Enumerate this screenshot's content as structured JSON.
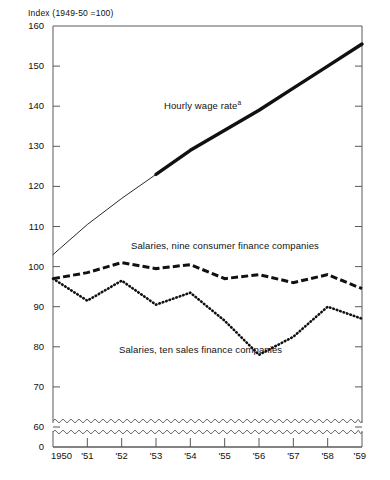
{
  "chart_data": {
    "type": "line",
    "title": "Index (1949-50 =100)",
    "xlabel": "",
    "ylabel": "Index (1949-50 =100)",
    "x": [
      1950,
      1951,
      1952,
      1953,
      1954,
      1955,
      1956,
      1957,
      1958,
      1959
    ],
    "categories": [
      "1950",
      "'51",
      "'52",
      "'53",
      "'54",
      "'55",
      "'56",
      "'57",
      "'58",
      "'59"
    ],
    "xlim": [
      1950,
      1959
    ],
    "ylim": [
      60,
      160
    ],
    "y_axis_break": true,
    "y_break_from": 0,
    "y_break_to": 60,
    "yticks": [
      160,
      150,
      140,
      130,
      120,
      110,
      100,
      90,
      80,
      70,
      60,
      0
    ],
    "ytick_labels": [
      "160",
      "150",
      "140",
      "130",
      "120",
      "110",
      "100",
      "90",
      "80",
      "70",
      "60",
      "0"
    ],
    "grid": false,
    "legend_position": "inline-annotations",
    "series": [
      {
        "name": "Hourly wage rate",
        "label": "Hourly wage rate",
        "footnote_marker": "a",
        "style": "solid",
        "note": "thin line 1950-1953, heavy line 1953-1959",
        "values": [
          103,
          110.5,
          117,
          123,
          129,
          134,
          139,
          144.5,
          150,
          155.5
        ]
      },
      {
        "name": "Salaries, nine consumer finance companies",
        "label": "Salaries, nine consumer finance companies",
        "style": "dashed",
        "values": [
          97,
          98.5,
          101,
          99.5,
          100.5,
          97,
          98,
          96,
          98,
          94.5
        ]
      },
      {
        "name": "Salaries, ten sales finance companies",
        "label": "Salaries, ten sales finance companies",
        "style": "dotted",
        "values": [
          97,
          91.5,
          96.5,
          90.5,
          93.5,
          86.5,
          78,
          82.5,
          90,
          87
        ]
      }
    ],
    "colors": {
      "line": "#111111",
      "axis": "#555555",
      "background": "#ffffff"
    }
  },
  "annotations": {
    "hourly_wage_label": "Hourly wage rate",
    "hourly_wage_superscript": "a",
    "consumer_finance_label": "Salaries, nine consumer finance companies",
    "sales_finance_label": "Salaries, ten sales finance companies"
  },
  "axis": {
    "index_title": "Index (1949-50 =100)",
    "y_labels": [
      "160",
      "150",
      "140",
      "130",
      "120",
      "110",
      "100",
      "90",
      "80",
      "70",
      "60",
      "0"
    ],
    "x_labels": [
      "1950",
      "'51",
      "'52",
      "'53",
      "'54",
      "'55",
      "'56",
      "'57",
      "'58",
      "'59"
    ]
  }
}
